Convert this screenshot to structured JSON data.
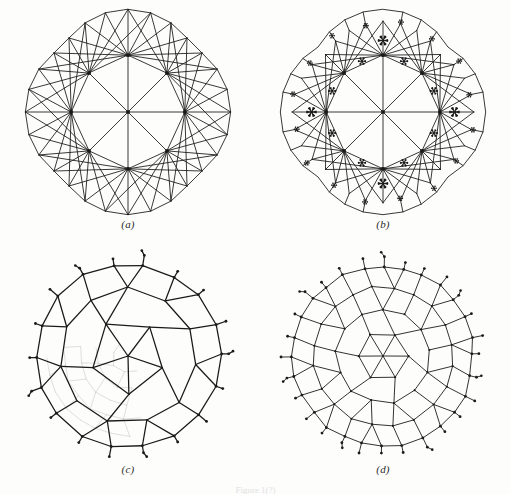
{
  "figure": {
    "background_color": "#fdfdfc",
    "ink_color": "#1a1a1a",
    "faded_ink_color": "#bdbdbd",
    "width": 511,
    "height": 494,
    "caption_partial": "Figure 1(?)"
  },
  "panels": [
    {
      "id": "a",
      "label": "(a)",
      "type": "triangulated-mesh",
      "description": "Triangulation of a rounded square region with 8 high-valence interior ring vertices and one central vertex",
      "vertex_marker": "square-dot",
      "marked_vertex_count": 9,
      "line_width": 0.9,
      "asterisk_count": 0
    },
    {
      "id": "b",
      "label": "(b)",
      "type": "triangulated-mesh-with-markers",
      "description": "Same triangulation as (a) refined near the boundary, with six-pointed asterisk markers placed at selected face centres",
      "vertex_marker": "square-dot",
      "marked_vertex_count": 9,
      "line_width": 0.9,
      "asterisk_count": 28,
      "asterisk_glyph": "six-pointed-star"
    },
    {
      "id": "c",
      "label": "(c)",
      "type": "dual-polygon-network",
      "description": "Dual polygonal (Voronoi-like) network of the triangulation, drawn bold, with a finer grey network showing through in the lower-left quadrant and dot-terminated stubs around the rim",
      "node_marker": "round-dot",
      "line_width": 1.3,
      "has_faded_underlay": true,
      "faded_underlay_region": "lower-left"
    },
    {
      "id": "d",
      "label": "(d)",
      "type": "dual-polygon-network",
      "description": "Finer dual polygonal network over the whole disc with dot-terminated stubs around the rim",
      "node_marker": "round-dot",
      "line_width": 0.9,
      "has_faded_underlay": false
    }
  ],
  "chart_data": {
    "type": "diagram",
    "title": "",
    "panel_layout": {
      "rows": 2,
      "cols": 2,
      "order": [
        "a",
        "b",
        "c",
        "d"
      ]
    },
    "panel_a": {
      "boundary_ring_radii": {
        "corner": 104,
        "edge": 112
      },
      "ring_vertices": 8,
      "center_vertex": 1,
      "outer_boundary_points": 28
    },
    "panel_b": {
      "asterisk_sizes": {
        "large": 9,
        "medium": 7,
        "small": 5
      },
      "asterisks_interior": 12,
      "asterisks_boundary": 16
    },
    "panel_c": {
      "polygon_rings": 3,
      "rim_stubs": 30
    },
    "panel_d": {
      "polygon_rings": 4,
      "rim_stubs": 38
    }
  }
}
